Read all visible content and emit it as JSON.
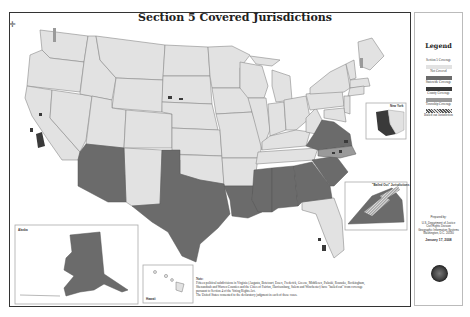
{
  "map": {
    "title": "Section 5 Covered Jurisdictions",
    "compass_icon": "compass-rose",
    "colors": {
      "not_covered": "#e2e2e2",
      "statewide": "#6b6b6b",
      "county": "#3a3a3a",
      "township": "#9a9a9a",
      "bailed_out": "#b8b8b8",
      "border": "#8a8a8a",
      "water": "#ffffff"
    },
    "statewide_covered_states": [
      "Arizona",
      "Texas",
      "Louisiana",
      "Mississippi",
      "Alabama",
      "Georgia",
      "South Carolina",
      "Virginia",
      "Alaska"
    ],
    "partially_covered_states": [
      "California",
      "South Dakota",
      "North Carolina",
      "Florida",
      "New York",
      "New Hampshire",
      "Michigan"
    ],
    "insets": {
      "alaska": {
        "label": "Alaska"
      },
      "hawaii": {
        "label": "Hawaii"
      },
      "new_york": {
        "label": "New York"
      },
      "bailed_out": {
        "label": "\"Bailed Out\" Jurisdictions"
      }
    },
    "note": {
      "heading": "Note:",
      "lines": [
        "Fifteen political subdivisions in Virginia (Augusta, Botetourt, Essex, Frederick, Greene, Middlesex, Pulaski, Roanoke, Rockingham,",
        "Shenandoah and Warren Counties and the Cities of Fairfax, Harrisonburg, Salem and Winchester) have \"bailed out\" from coverage",
        "pursuant to Section 4 of the Voting Rights Act.",
        "The United States consented to the declaratory judgment in each of these cases."
      ]
    }
  },
  "legend": {
    "title": "Legend",
    "subtitle": "Section 5 Coverage",
    "items": [
      {
        "label": "Not Covered",
        "swatch": "#e2e2e2"
      },
      {
        "label": "Statewide Coverage",
        "swatch": "#6b6b6b"
      },
      {
        "label": "County Coverage",
        "swatch": "#3a3a3a"
      },
      {
        "label": "Township Coverage",
        "swatch": "#9a9a9a"
      },
      {
        "label": "Bailed out Jurisdiction",
        "swatch": "hatched"
      }
    ],
    "prepared_by": {
      "label": "Prepared by:",
      "lines": [
        "U.S. Department of Justice",
        "Civil Rights Division",
        "Geographic Information Systems",
        "Washington, D.C. 20530"
      ]
    },
    "date": "January 17, 2008",
    "seal_icon": "doj-seal"
  }
}
